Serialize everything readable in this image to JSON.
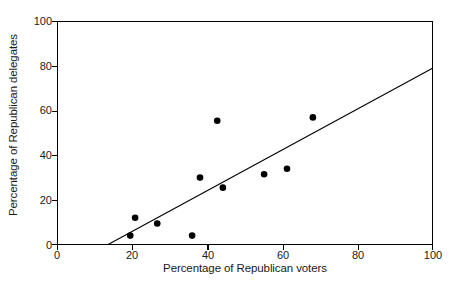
{
  "chart_data": {
    "type": "scatter",
    "title": "",
    "xlabel": "Percentage of Republican voters",
    "ylabel": "Percentage of Republican delegates",
    "xlim": [
      0,
      100
    ],
    "ylim": [
      0,
      100
    ],
    "xticks": [
      0,
      20,
      40,
      60,
      80,
      100
    ],
    "yticks": [
      0,
      20,
      40,
      60,
      80,
      100
    ],
    "xtick_labels": [
      "0",
      "20",
      "40",
      "60",
      "80",
      "100"
    ],
    "ytick_labels": [
      "0",
      "20",
      "40",
      "60",
      "80",
      "100"
    ],
    "grid": false,
    "legend": null,
    "marker": "filled-circle",
    "marker_color": "#000000",
    "axis_color": "#000000",
    "points": [
      {
        "x": 19.4,
        "y": 4.0
      },
      {
        "x": 20.7,
        "y": 12.0
      },
      {
        "x": 26.6,
        "y": 9.4
      },
      {
        "x": 35.9,
        "y": 4.0
      },
      {
        "x": 38.0,
        "y": 30.0
      },
      {
        "x": 42.6,
        "y": 55.5
      },
      {
        "x": 44.1,
        "y": 25.5
      },
      {
        "x": 55.1,
        "y": 31.5
      },
      {
        "x": 61.2,
        "y": 34.0
      },
      {
        "x": 68.1,
        "y": 57.0
      }
    ],
    "trendline": {
      "type": "line",
      "x_start": 13.5,
      "y_start": 0,
      "x_end": 100,
      "y_end": 79,
      "color": "#000000"
    }
  },
  "axes": {
    "x_title": "Percentage of Republican voters",
    "y_title": "Percentage of Republican delegates"
  }
}
